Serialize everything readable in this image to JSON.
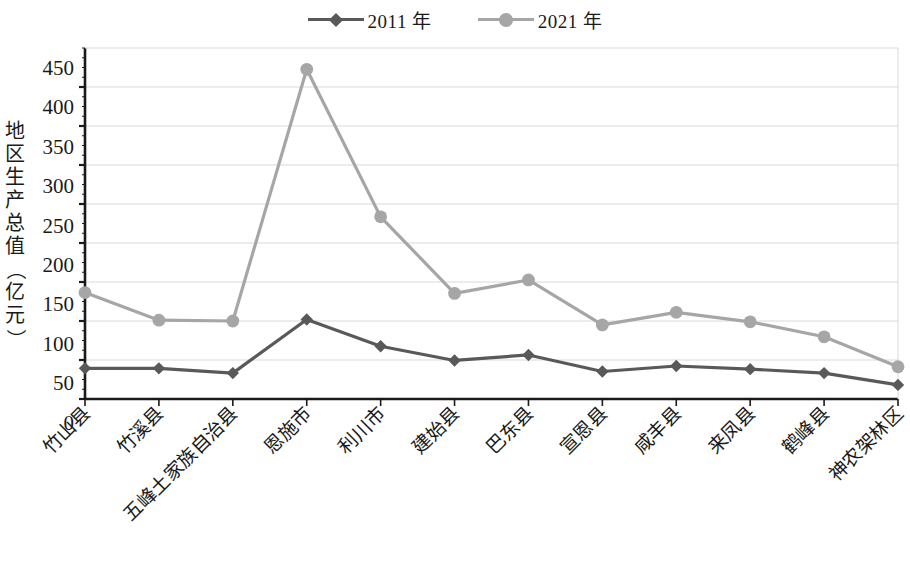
{
  "chart_data": {
    "type": "line",
    "title": "",
    "xlabel": "",
    "ylabel": "地区生产总值（亿元）",
    "ylim": [
      0,
      450
    ],
    "ytick_step": 50,
    "grid": true,
    "legend_position": "top-center",
    "categories": [
      "竹山县",
      "竹溪县",
      "五峰土家族自治县",
      "恩施市",
      "利川市",
      "建始县",
      "巴东县",
      "宣恩县",
      "咸丰县",
      "来凤县",
      "鹤峰县",
      "神农架林区"
    ],
    "ytick_labels": [
      "450",
      "400",
      "350",
      "300",
      "250",
      "200",
      "150",
      "100",
      "50",
      "0"
    ],
    "series": [
      {
        "name": "2011 年",
        "color": "#595959",
        "marker": "diamond",
        "values": [
          69,
          69,
          63,
          131,
          97,
          79,
          86,
          65,
          72,
          68,
          63,
          48
        ]
      },
      {
        "name": "2021 年",
        "color": "#a6a6a6",
        "marker": "circle",
        "values": [
          165,
          130,
          129,
          448,
          261,
          164,
          181,
          124,
          140,
          128,
          109,
          71
        ]
      }
    ]
  },
  "axis_title_chars": [
    "地",
    "区",
    "生",
    "产",
    "总",
    "值",
    "（",
    "亿",
    "元",
    "）"
  ],
  "colors": {
    "series_2011": "#595959",
    "series_2021": "#a6a6a6",
    "axis": "#1a1a1a",
    "grid": "#d9d9e0",
    "background": "#ffffff"
  }
}
